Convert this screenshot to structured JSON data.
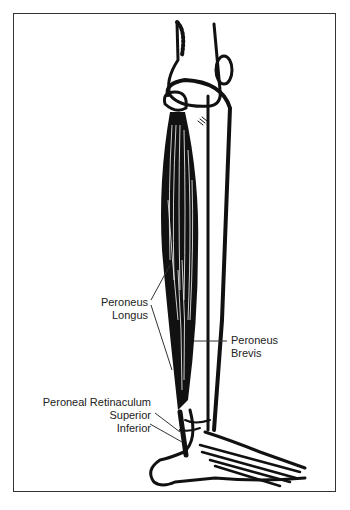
{
  "figure": {
    "labels": {
      "peroneus_longus_line1": "Peroneus",
      "peroneus_longus_line2": "Longus",
      "peroneus_brevis_line1": "Peroneus",
      "peroneus_brevis_line2": "Brevis",
      "retinaculum": "Peroneal Retinaculum",
      "superior": "Superior",
      "inferior": "Inferior"
    },
    "colors": {
      "ink": "#111111",
      "background": "#ffffff",
      "frame": "#333333"
    }
  }
}
